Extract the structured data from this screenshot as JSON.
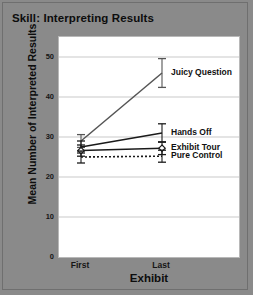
{
  "chart_data": {
    "type": "line",
    "title": "Skill: Interpreting Results",
    "xlabel": "Exhibit",
    "ylabel": "Mean Number of Interpreted Results",
    "categories": [
      "First",
      "Last"
    ],
    "x_tick_labels": [
      "First",
      "Last"
    ],
    "y_tick_labels": [
      "0",
      "10",
      "20",
      "30",
      "40",
      "50"
    ],
    "y_ticks": [
      0,
      10,
      20,
      30,
      40,
      50
    ],
    "ylim": [
      0,
      55
    ],
    "grid": true,
    "legend_position": "inline-right-of-last-point",
    "series": [
      {
        "name": "Juicy Question",
        "values": [
          29.0,
          46.0
        ],
        "errors": [
          1.6,
          3.6
        ],
        "style": "solid",
        "color": "#555555",
        "marker": "none",
        "label_y_value": 46.0
      },
      {
        "name": "Hands Off",
        "values": [
          27.5,
          31.0
        ],
        "errors": [
          1.5,
          2.3
        ],
        "style": "solid",
        "color": "#1a1a1a",
        "marker": "none",
        "label_y_value": 31.0
      },
      {
        "name": "Exhibit Tour",
        "values": [
          26.6,
          27.2
        ],
        "errors": [
          1.4,
          1.6
        ],
        "style": "solid",
        "color": "#1a1a1a",
        "marker": "open-diamond",
        "label_y_value": 27.2
      },
      {
        "name": "Pure Control",
        "values": [
          25.0,
          25.2
        ],
        "errors": [
          1.5,
          1.5
        ],
        "style": "dotted",
        "color": "#1a1a1a",
        "marker": "none",
        "label_y_value": 25.2
      }
    ]
  },
  "colors": {
    "figure_background": "#8a8a8a",
    "plot_background": "#ffffff",
    "gridline": "#c9c9c9",
    "text": "#0d0d0d"
  }
}
